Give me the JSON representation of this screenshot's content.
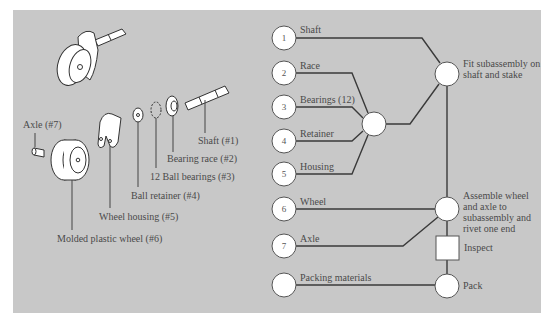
{
  "figure": {
    "background_color": "#c8c8c8",
    "line_color": "#3a3a3a",
    "node_fill": "#ffffff"
  },
  "illustration": {
    "title": "Exploded view of caster assembly",
    "parts": [
      {
        "id": 1,
        "label": "Shaft (#1)"
      },
      {
        "id": 2,
        "label": "Bearing race (#2)"
      },
      {
        "id": 3,
        "label": "12 Ball bearings (#3)"
      },
      {
        "id": 4,
        "label": "Ball retainer (#4)"
      },
      {
        "id": 5,
        "label": "Wheel housing (#5)"
      },
      {
        "id": 6,
        "label": "Molded plastic wheel (#6)"
      },
      {
        "id": 7,
        "label": "Axle (#7)"
      }
    ]
  },
  "flow": {
    "inputs": [
      {
        "number": "1",
        "label": "Shaft"
      },
      {
        "number": "2",
        "label": "Race"
      },
      {
        "number": "3",
        "label": "Bearings (12)"
      },
      {
        "number": "4",
        "label": "Retainer"
      },
      {
        "number": "5",
        "label": "Housing"
      },
      {
        "number": "6",
        "label": "Wheel"
      },
      {
        "number": "7",
        "label": "Axle"
      },
      {
        "number": "",
        "label": "Packing materials"
      }
    ],
    "operations": [
      {
        "id": "subassembly",
        "type": "operation",
        "label": ""
      },
      {
        "id": "fit",
        "type": "operation",
        "label": "Fit subassembly on shaft and stake"
      },
      {
        "id": "assemble",
        "type": "operation",
        "label": "Assemble wheel and axle to subassembly and rivet one end"
      },
      {
        "id": "inspect",
        "type": "inspection",
        "label": "Inspect"
      },
      {
        "id": "pack",
        "type": "operation",
        "label": "Pack"
      }
    ]
  }
}
